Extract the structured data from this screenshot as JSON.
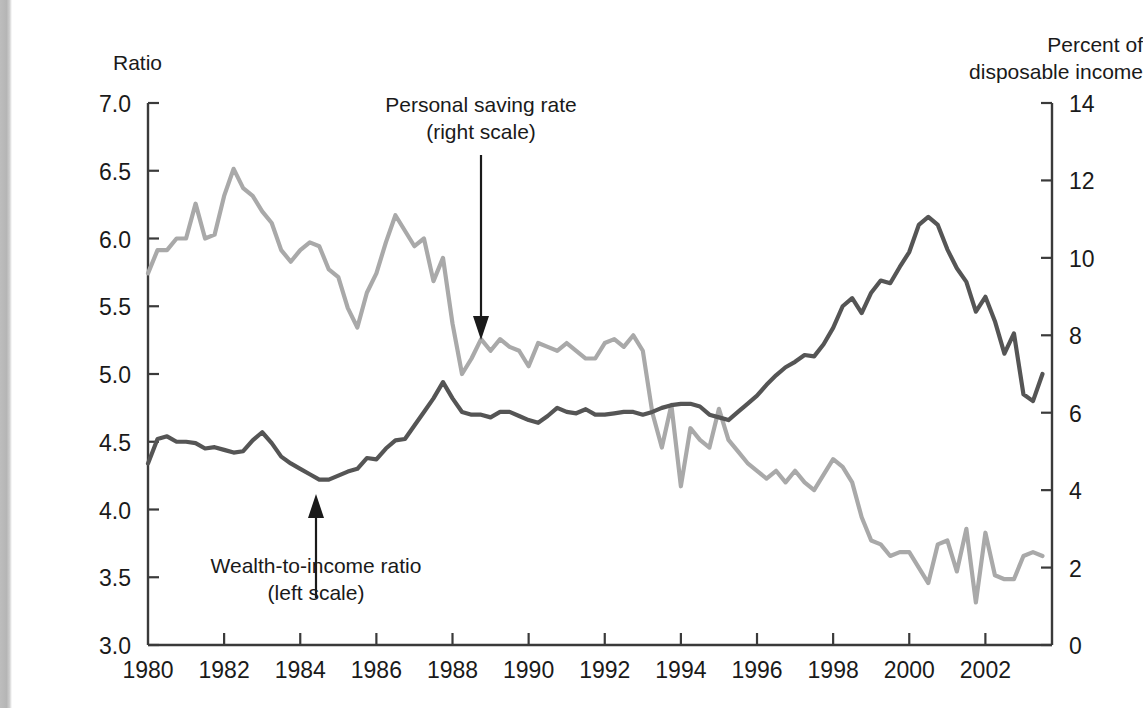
{
  "figure": {
    "left_axis_title": "Ratio",
    "right_axis_title_line1": "Percent of",
    "right_axis_title_line2": "disposable income",
    "annotation_saving_line1": "Personal saving rate",
    "annotation_saving_line2": "(right scale)",
    "annotation_wealth_line1": "Wealth-to-income ratio",
    "annotation_wealth_line2": "(left scale)"
  },
  "colors": {
    "wealth_line": "#555555",
    "saving_line": "#a9a9a9",
    "axis": "#3a3a3a",
    "text": "#1a1a1a"
  },
  "chart_data": {
    "type": "line",
    "title": "",
    "xlabel": "",
    "grid": false,
    "legend": "annotations-with-arrows",
    "xlim": [
      1980.0,
      2003.75
    ],
    "x_ticks": [
      "1980",
      "1982",
      "1984",
      "1986",
      "1988",
      "1990",
      "1992",
      "1994",
      "1996",
      "1998",
      "2000",
      "2002"
    ],
    "x_tick_values": [
      1980,
      1982,
      1984,
      1986,
      1988,
      1990,
      1992,
      1994,
      1996,
      1998,
      2000,
      2002
    ],
    "left_axis": {
      "label": "Ratio",
      "ylim": [
        3.0,
        7.0
      ],
      "ticks": [
        3.0,
        3.5,
        4.0,
        4.5,
        5.0,
        5.5,
        6.0,
        6.5,
        7.0
      ],
      "tick_labels": [
        "3.0",
        "3.5",
        "4.0",
        "4.5",
        "5.0",
        "5.5",
        "6.0",
        "6.5",
        "7.0"
      ]
    },
    "right_axis": {
      "label": "Percent of disposable income",
      "ylim": [
        0,
        14
      ],
      "ticks": [
        0,
        2,
        4,
        6,
        8,
        10,
        12,
        14
      ],
      "tick_labels": [
        "0",
        "2",
        "4",
        "6",
        "8",
        "10",
        "12",
        "14"
      ]
    },
    "series": [
      {
        "name": "Wealth-to-income ratio (left scale)",
        "axis": "left",
        "color": "#555555",
        "x": [
          1980.0,
          1980.25,
          1980.5,
          1980.75,
          1981.0,
          1981.25,
          1981.5,
          1981.75,
          1982.0,
          1982.25,
          1982.5,
          1982.75,
          1983.0,
          1983.25,
          1983.5,
          1983.75,
          1984.0,
          1984.25,
          1984.5,
          1984.75,
          1985.0,
          1985.25,
          1985.5,
          1985.75,
          1986.0,
          1986.25,
          1986.5,
          1986.75,
          1987.0,
          1987.25,
          1987.5,
          1987.75,
          1988.0,
          1988.25,
          1988.5,
          1988.75,
          1989.0,
          1989.25,
          1989.5,
          1989.75,
          1990.0,
          1990.25,
          1990.5,
          1990.75,
          1991.0,
          1991.25,
          1991.5,
          1991.75,
          1992.0,
          1992.25,
          1992.5,
          1992.75,
          1993.0,
          1993.25,
          1993.5,
          1993.75,
          1994.0,
          1994.25,
          1994.5,
          1994.75,
          1995.0,
          1995.25,
          1995.5,
          1995.75,
          1996.0,
          1996.25,
          1996.5,
          1996.75,
          1997.0,
          1997.25,
          1997.5,
          1997.75,
          1998.0,
          1998.25,
          1998.5,
          1998.75,
          1999.0,
          1999.25,
          1999.5,
          1999.75,
          2000.0,
          2000.25,
          2000.5,
          2000.75,
          2001.0,
          2001.25,
          2001.5,
          2001.75,
          2002.0,
          2002.25,
          2002.5,
          2002.75,
          2003.0,
          2003.25,
          2003.5
        ],
        "y": [
          4.34,
          4.52,
          4.54,
          4.5,
          4.5,
          4.49,
          4.45,
          4.46,
          4.44,
          4.42,
          4.43,
          4.51,
          4.57,
          4.49,
          4.39,
          4.34,
          4.3,
          4.26,
          4.22,
          4.22,
          4.25,
          4.28,
          4.3,
          4.38,
          4.37,
          4.45,
          4.51,
          4.52,
          4.62,
          4.72,
          4.82,
          4.94,
          4.82,
          4.72,
          4.7,
          4.7,
          4.68,
          4.72,
          4.72,
          4.69,
          4.66,
          4.64,
          4.69,
          4.75,
          4.72,
          4.71,
          4.74,
          4.7,
          4.7,
          4.71,
          4.72,
          4.72,
          4.7,
          4.72,
          4.75,
          4.77,
          4.78,
          4.78,
          4.76,
          4.7,
          4.68,
          4.66,
          4.72,
          4.78,
          4.84,
          4.92,
          4.99,
          5.05,
          5.09,
          5.14,
          5.13,
          5.22,
          5.34,
          5.5,
          5.56,
          5.45,
          5.6,
          5.69,
          5.67,
          5.79,
          5.9,
          6.1,
          6.16,
          6.1,
          5.92,
          5.78,
          5.68,
          5.46,
          5.57,
          5.39,
          5.15,
          5.3,
          4.85,
          4.8,
          5.0
        ]
      },
      {
        "name": "Personal saving rate (right scale)",
        "axis": "right",
        "color": "#a9a9a9",
        "x": [
          1980.0,
          1980.25,
          1980.5,
          1980.75,
          1981.0,
          1981.25,
          1981.5,
          1981.75,
          1982.0,
          1982.25,
          1982.5,
          1982.75,
          1983.0,
          1983.25,
          1983.5,
          1983.75,
          1984.0,
          1984.25,
          1984.5,
          1984.75,
          1985.0,
          1985.25,
          1985.5,
          1985.75,
          1986.0,
          1986.25,
          1986.5,
          1986.75,
          1987.0,
          1987.25,
          1987.5,
          1987.75,
          1988.0,
          1988.25,
          1988.5,
          1988.75,
          1989.0,
          1989.25,
          1989.5,
          1989.75,
          1990.0,
          1990.25,
          1990.5,
          1990.75,
          1991.0,
          1991.25,
          1991.5,
          1991.75,
          1992.0,
          1992.25,
          1992.5,
          1992.75,
          1993.0,
          1993.25,
          1993.5,
          1993.75,
          1994.0,
          1994.25,
          1994.5,
          1994.75,
          1995.0,
          1995.25,
          1995.5,
          1995.75,
          1996.0,
          1996.25,
          1996.5,
          1996.75,
          1997.0,
          1997.25,
          1997.5,
          1997.75,
          1998.0,
          1998.25,
          1998.5,
          1998.75,
          1999.0,
          1999.25,
          1999.5,
          1999.75,
          2000.0,
          2000.25,
          2000.5,
          2000.75,
          2001.0,
          2001.25,
          2001.5,
          2001.75,
          2002.0,
          2002.25,
          2002.5,
          2002.75,
          2003.0,
          2003.25,
          2003.5
        ],
        "y": [
          9.6,
          10.2,
          10.2,
          10.5,
          10.5,
          11.4,
          10.5,
          10.6,
          11.6,
          12.3,
          11.8,
          11.6,
          11.2,
          10.9,
          10.2,
          9.9,
          10.2,
          10.4,
          10.3,
          9.7,
          9.5,
          8.7,
          8.2,
          9.1,
          9.6,
          10.4,
          11.1,
          10.7,
          10.3,
          10.5,
          9.4,
          10.0,
          8.3,
          7.0,
          7.4,
          7.9,
          7.6,
          7.9,
          7.7,
          7.6,
          7.2,
          7.8,
          7.7,
          7.6,
          7.8,
          7.6,
          7.4,
          7.4,
          7.8,
          7.9,
          7.7,
          8.0,
          7.6,
          6.0,
          5.1,
          6.2,
          4.1,
          5.6,
          5.3,
          5.1,
          6.1,
          5.3,
          5.0,
          4.7,
          4.5,
          4.3,
          4.5,
          4.2,
          4.5,
          4.2,
          4.0,
          4.4,
          4.8,
          4.6,
          4.2,
          3.3,
          2.7,
          2.6,
          2.3,
          2.4,
          2.4,
          2.0,
          1.6,
          2.6,
          2.7,
          1.9,
          3.0,
          1.1,
          2.9,
          1.8,
          1.7,
          1.7,
          2.3,
          2.4,
          2.3
        ]
      }
    ],
    "annotations": [
      {
        "text": "Personal saving rate (right scale)",
        "points_to_series": "Personal saving rate (right scale)",
        "arrow_direction": "down",
        "near_year": 1988.8
      },
      {
        "text": "Wealth-to-income ratio (left scale)",
        "points_to_series": "Wealth-to-income ratio (left scale)",
        "arrow_direction": "up",
        "near_year": 1984.6
      }
    ]
  }
}
